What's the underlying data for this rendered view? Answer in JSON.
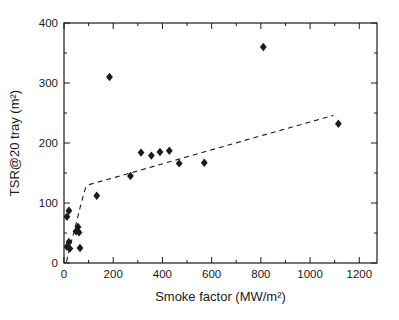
{
  "figure": {
    "background": "#ffffff",
    "frame_color": "#1a1a1a",
    "text_color": "#1a1a1a",
    "marker_color": "#1a1a1a",
    "trend_color": "#1a1a1a"
  },
  "chart_data": {
    "type": "scatter",
    "title": "",
    "xlabel": "Smoke factor (MW/m²)",
    "ylabel": "TSR@20 tray (m²)",
    "xlim": [
      0,
      1272
    ],
    "ylim": [
      0,
      400
    ],
    "x_major_ticks": [
      0,
      200,
      400,
      600,
      800,
      1000,
      1200
    ],
    "x_minor_ticks": [
      100,
      300,
      500,
      700,
      900,
      1100
    ],
    "y_major_ticks": [
      0,
      100,
      200,
      300,
      400
    ],
    "y_minor_ticks": [
      50,
      150,
      250,
      350
    ],
    "grid": false,
    "legend": null,
    "marker": {
      "shape": "diamond",
      "color": "#1a1a1a",
      "half_width": 3.4,
      "half_height": 4.2
    },
    "points": [
      [
        12,
        77
      ],
      [
        20,
        87
      ],
      [
        49,
        53
      ],
      [
        57,
        60
      ],
      [
        61,
        51
      ],
      [
        20,
        35
      ],
      [
        12,
        27
      ],
      [
        24,
        24
      ],
      [
        65,
        25
      ],
      [
        133,
        112
      ],
      [
        185,
        310
      ],
      [
        270,
        145
      ],
      [
        313,
        184
      ],
      [
        355,
        179
      ],
      [
        390,
        185
      ],
      [
        428,
        187
      ],
      [
        468,
        166
      ],
      [
        570,
        167
      ],
      [
        810,
        360
      ],
      [
        1115,
        232
      ]
    ],
    "trend_line": {
      "style": "dashed",
      "dash": "5 4",
      "color": "#1a1a1a",
      "points": [
        [
          10,
          2
        ],
        [
          22,
          24
        ],
        [
          38,
          48
        ],
        [
          52,
          70
        ],
        [
          66,
          93
        ],
        [
          78,
          112
        ],
        [
          88,
          126
        ],
        [
          105,
          131
        ],
        [
          270,
          150
        ],
        [
          500,
          177
        ],
        [
          800,
          212
        ],
        [
          1000,
          235
        ],
        [
          1095,
          246
        ]
      ]
    },
    "layout": {
      "plot_left": 64,
      "plot_right": 377,
      "plot_top": 23,
      "plot_bottom": 263,
      "major_tick_len": 6,
      "minor_tick_len": 3,
      "tick_font_size": 11.5,
      "label_font_size": 13
    }
  }
}
